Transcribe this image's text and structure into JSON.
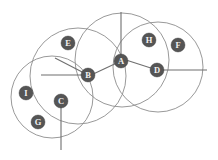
{
  "diagram": {
    "type": "overlapping-circles",
    "width": 218,
    "height": 160,
    "background_color": "#ffffff",
    "circle_stroke_color": "#8d8d8d",
    "node_fill_color": "#555555",
    "node_text_color": "#f2f2f2",
    "spoke_color": "#6f6f6f",
    "circles": [
      {
        "name": "circle-left",
        "cx": 52,
        "cy": 97,
        "r": 41
      },
      {
        "name": "circle-left-center",
        "cx": 78,
        "cy": 76,
        "r": 48
      },
      {
        "name": "circle-right-center",
        "cx": 122,
        "cy": 60,
        "r": 47
      },
      {
        "name": "circle-right",
        "cx": 158,
        "cy": 67,
        "r": 45
      }
    ],
    "nodes": [
      {
        "id": "A",
        "label": "A",
        "cx": 121,
        "cy": 61,
        "r": 7.0
      },
      {
        "id": "B",
        "label": "B",
        "cx": 88,
        "cy": 75,
        "r": 7.0
      },
      {
        "id": "C",
        "label": "C",
        "cx": 61,
        "cy": 101,
        "r": 7.0
      },
      {
        "id": "D",
        "label": "D",
        "cx": 157,
        "cy": 70,
        "r": 7.0
      },
      {
        "id": "E",
        "label": "E",
        "cx": 68,
        "cy": 43,
        "r": 7.0
      },
      {
        "id": "F",
        "label": "F",
        "cx": 178,
        "cy": 45,
        "r": 7.0
      },
      {
        "id": "G",
        "label": "G",
        "cx": 38,
        "cy": 122,
        "r": 7.0
      },
      {
        "id": "H",
        "label": "H",
        "cx": 149,
        "cy": 40,
        "r": 7.0
      },
      {
        "id": "I",
        "label": "I",
        "cx": 26,
        "cy": 93,
        "r": 7.0
      }
    ],
    "spokes": [
      {
        "name": "spoke-a-up",
        "x1": 121,
        "y1": 61,
        "x2": 121,
        "y2": 12
      },
      {
        "name": "spoke-a-left",
        "x1": 121,
        "y1": 61,
        "x2": 89,
        "y2": 76
      },
      {
        "name": "spoke-b-left",
        "x1": 88,
        "y1": 75,
        "x2": 41,
        "y2": 75
      },
      {
        "name": "spoke-b-upleft",
        "x1": 88,
        "y1": 75,
        "x2": 55,
        "y2": 58
      },
      {
        "name": "spoke-c-down",
        "x1": 61,
        "y1": 101,
        "x2": 61,
        "y2": 150
      },
      {
        "name": "spoke-d-right",
        "x1": 157,
        "y1": 70,
        "x2": 207,
        "y2": 70
      },
      {
        "name": "spoke-d-left",
        "x1": 157,
        "y1": 70,
        "x2": 126,
        "y2": 60
      }
    ]
  }
}
